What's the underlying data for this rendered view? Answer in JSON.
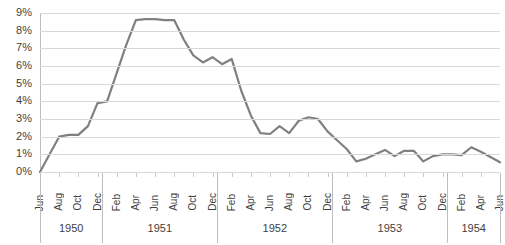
{
  "chart_data": {
    "type": "line",
    "title": "",
    "xlabel": "",
    "ylabel": "",
    "ylim": [
      0,
      9
    ],
    "ytick_labels": [
      "0%",
      "1%",
      "2%",
      "3%",
      "4%",
      "5%",
      "6%",
      "7%",
      "8%",
      "9%"
    ],
    "ytick_values": [
      0,
      1,
      2,
      3,
      4,
      5,
      6,
      7,
      8,
      9
    ],
    "grid": true,
    "legend": "none",
    "line_color": "#808080",
    "x": [
      "Jun 1950",
      "Jul 1950",
      "Aug 1950",
      "Sep 1950",
      "Oct 1950",
      "Nov 1950",
      "Dec 1950",
      "Jan 1951",
      "Feb 1951",
      "Mar 1951",
      "Apr 1951",
      "May 1951",
      "Jun 1951",
      "Jul 1951",
      "Aug 1951",
      "Sep 1951",
      "Oct 1951",
      "Nov 1951",
      "Dec 1951",
      "Jan 1952",
      "Feb 1952",
      "Mar 1952",
      "Apr 1952",
      "May 1952",
      "Jun 1952",
      "Jul 1952",
      "Aug 1952",
      "Sep 1952",
      "Oct 1952",
      "Nov 1952",
      "Dec 1952",
      "Jan 1953",
      "Feb 1953",
      "Mar 1953",
      "Apr 1953",
      "May 1953",
      "Jun 1953",
      "Jul 1953",
      "Aug 1953",
      "Sep 1953",
      "Oct 1953",
      "Nov 1953",
      "Dec 1953",
      "Jan 1954",
      "Feb 1954",
      "Mar 1954",
      "Apr 1954",
      "May 1954",
      "Jun 1954"
    ],
    "values": [
      0.0,
      1.0,
      2.0,
      2.1,
      2.1,
      2.6,
      3.9,
      4.0,
      5.6,
      7.2,
      8.6,
      8.65,
      8.65,
      8.6,
      8.6,
      7.5,
      6.6,
      6.2,
      6.5,
      6.1,
      6.4,
      4.6,
      3.2,
      2.2,
      2.15,
      2.6,
      2.2,
      2.9,
      3.1,
      3.0,
      2.3,
      1.8,
      1.3,
      0.6,
      0.75,
      1.0,
      1.25,
      0.9,
      1.2,
      1.2,
      0.6,
      0.9,
      1.0,
      1.0,
      0.95,
      1.4,
      1.15,
      0.85,
      0.55
    ],
    "month_ticks": [
      {
        "label": "Jun",
        "index": 0
      },
      {
        "label": "Aug",
        "index": 2
      },
      {
        "label": "Oct",
        "index": 4
      },
      {
        "label": "Dec",
        "index": 6
      },
      {
        "label": "Feb",
        "index": 8
      },
      {
        "label": "Apr",
        "index": 10
      },
      {
        "label": "Jun",
        "index": 12
      },
      {
        "label": "Aug",
        "index": 14
      },
      {
        "label": "Oct",
        "index": 16
      },
      {
        "label": "Dec",
        "index": 18
      },
      {
        "label": "Feb",
        "index": 20
      },
      {
        "label": "Apr",
        "index": 22
      },
      {
        "label": "Jun",
        "index": 24
      },
      {
        "label": "Aug",
        "index": 26
      },
      {
        "label": "Oct",
        "index": 28
      },
      {
        "label": "Dec",
        "index": 30
      },
      {
        "label": "Feb",
        "index": 32
      },
      {
        "label": "Apr",
        "index": 34
      },
      {
        "label": "Jun",
        "index": 36
      },
      {
        "label": "Aug",
        "index": 38
      },
      {
        "label": "Oct",
        "index": 40
      },
      {
        "label": "Dec",
        "index": 42
      },
      {
        "label": "Feb",
        "index": 44
      },
      {
        "label": "Apr",
        "index": 46
      },
      {
        "label": "Jun",
        "index": 48
      }
    ],
    "year_groups": [
      {
        "label": "1950",
        "start": 0,
        "end": 6
      },
      {
        "label": "1951",
        "start": 7,
        "end": 18
      },
      {
        "label": "1952",
        "start": 19,
        "end": 30
      },
      {
        "label": "1953",
        "start": 31,
        "end": 42
      },
      {
        "label": "1954",
        "start": 43,
        "end": 48
      }
    ]
  }
}
